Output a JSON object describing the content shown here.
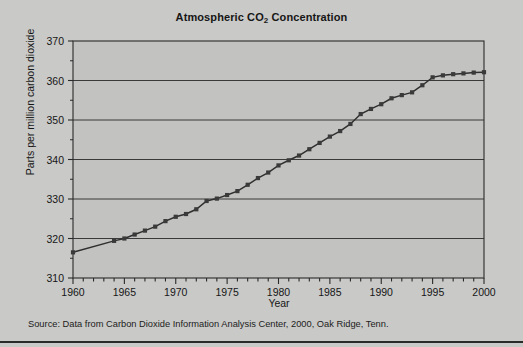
{
  "figure": {
    "title_prefix": "Atmospheric CO",
    "title_sub": "2",
    "title_suffix": " Concentration",
    "title_full": "Atmospheric CO2 Concentration",
    "source_note": "Source: Data from Carbon Dioxide Information Analysis Center, 2000, Oak Ridge, Tenn.",
    "x_axis_title": "Year",
    "y_axis_title": "Parts per million carbon dioxide"
  },
  "colors": {
    "page_background": "#c9c9c7",
    "plot_background": "#c2c2c0",
    "axis": "#2a2a2a",
    "gridline": "#2a2a2a",
    "series_line": "#2f2f2f",
    "marker": "#3a3a3a",
    "text": "#161616"
  },
  "chart_data": {
    "type": "line",
    "title": "Atmospheric CO2 Concentration",
    "xlabel": "Year",
    "ylabel": "Parts per million carbon dioxide",
    "xlim": [
      1960,
      2000
    ],
    "ylim": [
      310,
      370
    ],
    "x_major_ticks": [
      1960,
      1965,
      1970,
      1975,
      1980,
      1985,
      1990,
      1995,
      2000
    ],
    "x_major_tick_labels": [
      "1960",
      "1965",
      "1970",
      "1975",
      "1980",
      "1985",
      "1990",
      "1995",
      "2000"
    ],
    "x_minor_tick_interval": 1,
    "y_major_ticks": [
      310,
      320,
      330,
      340,
      350,
      360,
      370
    ],
    "y_major_tick_labels": [
      "310",
      "320",
      "330",
      "340",
      "350",
      "360",
      "370"
    ],
    "y_minor_tick_interval": 5,
    "grid": "horizontal",
    "legend": null,
    "marker": "square",
    "series": [
      {
        "name": "Atmospheric CO2 concentration",
        "x": [
          1960,
          1964,
          1965,
          1966,
          1967,
          1968,
          1969,
          1970,
          1971,
          1972,
          1973,
          1974,
          1975,
          1976,
          1977,
          1978,
          1979,
          1980,
          1981,
          1982,
          1983,
          1984,
          1985,
          1986,
          1987,
          1988,
          1989,
          1990,
          1991,
          1992,
          1993,
          1994,
          1995,
          1996,
          1997,
          1998,
          1999,
          2000
        ],
        "values": [
          316.5,
          319.4,
          320.0,
          321.0,
          322.0,
          323.0,
          324.4,
          325.5,
          326.2,
          327.4,
          329.5,
          330.1,
          331.0,
          332.0,
          333.6,
          335.3,
          336.7,
          338.5,
          339.8,
          341.0,
          342.6,
          344.2,
          345.8,
          347.2,
          349.0,
          351.5,
          352.8,
          354.0,
          355.5,
          356.3,
          357.0,
          358.8,
          360.8,
          361.3,
          361.6,
          361.8,
          362.0,
          362.1
        ],
        "units": "parts per million"
      }
    ]
  }
}
